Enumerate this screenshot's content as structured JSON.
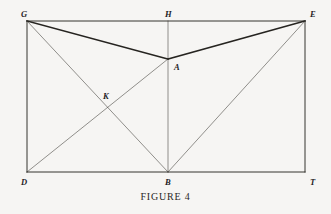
{
  "figure": {
    "caption": "FIGURE 4",
    "background_color": "#f6f5f3",
    "ink_color": "#3a3833",
    "heavy_ink_color": "#262420",
    "vertices": [
      {
        "id": "G",
        "label": "G",
        "x": 27,
        "y": 21,
        "label_x": 21,
        "label_y": 10
      },
      {
        "id": "H",
        "label": "H",
        "x": 168,
        "y": 21,
        "label_x": 165,
        "label_y": 10
      },
      {
        "id": "E",
        "label": "E",
        "x": 305,
        "y": 21,
        "label_x": 310,
        "label_y": 10
      },
      {
        "id": "A",
        "label": "A",
        "x": 168,
        "y": 59,
        "label_x": 174,
        "label_y": 63
      },
      {
        "id": "K",
        "label": "K",
        "x": 107,
        "y": 107,
        "label_x": 103,
        "label_y": 92
      },
      {
        "id": "D",
        "label": "D",
        "x": 27,
        "y": 172,
        "label_x": 21,
        "label_y": 178
      },
      {
        "id": "B",
        "label": "B",
        "x": 168,
        "y": 172,
        "label_x": 165,
        "label_y": 178
      },
      {
        "id": "T",
        "label": "T",
        "x": 305,
        "y": 172,
        "label_x": 310,
        "label_y": 178
      }
    ],
    "segments": [
      {
        "name": "side-GE-top",
        "from": "G",
        "to": "E",
        "weight": "medium"
      },
      {
        "name": "side-GD-left",
        "from": "G",
        "to": "D",
        "weight": "medium"
      },
      {
        "name": "side-ET-right",
        "from": "E",
        "to": "T",
        "weight": "medium"
      },
      {
        "name": "side-DT-bottom",
        "from": "D",
        "to": "T",
        "weight": "medium"
      },
      {
        "name": "segment-HB",
        "from": "H",
        "to": "B",
        "weight": "light"
      },
      {
        "name": "segment-GA",
        "from": "G",
        "to": "A",
        "weight": "heavy"
      },
      {
        "name": "segment-AE",
        "from": "A",
        "to": "E",
        "weight": "heavy"
      },
      {
        "name": "segment-GB",
        "from": "G",
        "to": "B",
        "weight": "light"
      },
      {
        "name": "segment-DA",
        "from": "D",
        "to": "A",
        "weight": "light"
      },
      {
        "name": "segment-BE",
        "from": "B",
        "to": "E",
        "weight": "light"
      }
    ]
  }
}
